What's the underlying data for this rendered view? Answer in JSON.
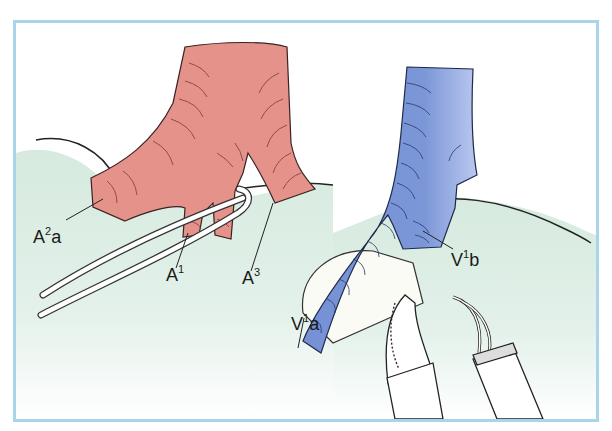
{
  "figure": {
    "type": "surgical-illustration",
    "frame_color": "#a9d4ea",
    "colors": {
      "artery": "#e5938a",
      "vein": "#7b96d6",
      "lung": "#d9ebe2",
      "outline": "#222222"
    },
    "labels": [
      {
        "id": "A2a",
        "base": "A",
        "sup": "2",
        "suffix": "a"
      },
      {
        "id": "A1",
        "base": "A",
        "sup": "1",
        "suffix": ""
      },
      {
        "id": "A3",
        "base": "A",
        "sup": "3",
        "suffix": ""
      },
      {
        "id": "V1a",
        "base": "V",
        "sup": "1",
        "suffix": "a"
      },
      {
        "id": "V1b",
        "base": "V",
        "sup": "1",
        "suffix": "b"
      }
    ]
  }
}
